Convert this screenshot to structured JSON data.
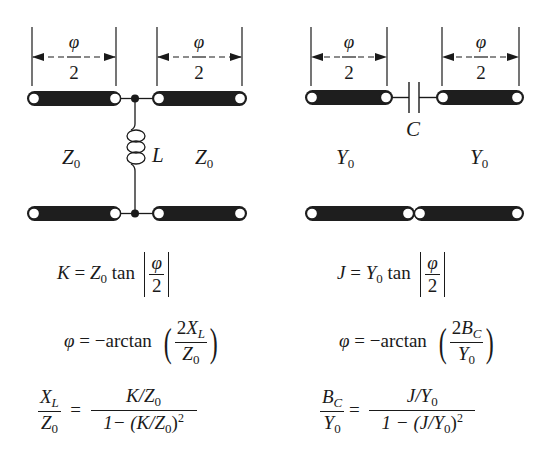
{
  "left_circuit": {
    "dimension_top": {
      "numerator": "φ",
      "denominator": "2"
    },
    "dimension_right": {
      "numerator": "φ",
      "denominator": "2"
    },
    "element_label": "L",
    "impedance_left": {
      "symbol": "Z",
      "sub": "0"
    },
    "impedance_right": {
      "symbol": "Z",
      "sub": "0"
    },
    "element_type": "shunt-inductor"
  },
  "right_circuit": {
    "dimension_left": {
      "numerator": "φ",
      "denominator": "2"
    },
    "dimension_right": {
      "numerator": "φ",
      "denominator": "2"
    },
    "element_label": "C",
    "admittance_left": {
      "symbol": "Y",
      "sub": "0"
    },
    "admittance_right": {
      "symbol": "Y",
      "sub": "0"
    },
    "element_type": "series-capacitor"
  },
  "left_equations": {
    "eq1": {
      "lhs": "K",
      "eq": "=",
      "z": "Z",
      "zsub": "0",
      "fn": "tan",
      "num": "φ",
      "den": "2"
    },
    "eq2": {
      "lhs": "φ",
      "eq": "= −arctan",
      "num_coef": "2",
      "num_var": "X",
      "num_sub": "L",
      "den_var": "Z",
      "den_sub": "0"
    },
    "eq3": {
      "lhs_num": "X",
      "lhs_num_sub": "L",
      "lhs_den": "Z",
      "lhs_den_sub": "0",
      "eq": "=",
      "rhs_num_a": "K/Z",
      "rhs_num_sub": "0",
      "rhs_den_a": "1− (K/Z",
      "rhs_den_sub": "0",
      "rhs_den_b": ")",
      "rhs_den_sup": "2"
    }
  },
  "right_equations": {
    "eq1": {
      "lhs": "J",
      "eq": "=",
      "y": "Y",
      "ysub": "0",
      "fn": "tan",
      "num": "φ",
      "den": "2"
    },
    "eq2": {
      "lhs": "φ",
      "eq": "= −arctan",
      "num_coef": "2",
      "num_var": "B",
      "num_sub": "C",
      "den_var": "Y",
      "den_sub": "0"
    },
    "eq3": {
      "lhs_num": "B",
      "lhs_num_sub": "C",
      "lhs_den": "Y",
      "lhs_den_sub": "0",
      "eq": "=",
      "rhs_num_a": "J/Y",
      "rhs_num_sub": "0",
      "rhs_den_a": "1 − (J/Y",
      "rhs_den_sub": "0",
      "rhs_den_b": ")",
      "rhs_den_sup": "2"
    }
  }
}
